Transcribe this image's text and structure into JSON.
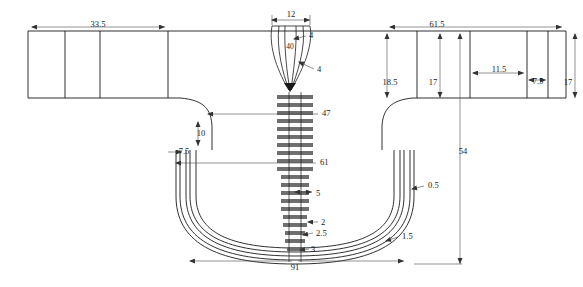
{
  "drawing": {
    "title": "Technical cross-section drawing with dimensions",
    "line_color": "#1a1a1a",
    "dim_line_color": "#666666",
    "dimensions": [
      {
        "id": "d_33_5",
        "label": "33.5",
        "x": 98,
        "y": 27,
        "size": "normal"
      },
      {
        "id": "d_12",
        "label": "12",
        "x": 291,
        "y": 17,
        "size": "normal"
      },
      {
        "id": "d_61_5",
        "label": "61.5",
        "x": 437,
        "y": 27,
        "size": "normal"
      },
      {
        "id": "d_4_top",
        "label": "4",
        "x": 300,
        "y": 36,
        "size": "normal"
      },
      {
        "id": "d_40",
        "label": "40",
        "x": 290,
        "y": 47,
        "size": "small"
      },
      {
        "id": "d_4_low",
        "label": "4",
        "x": 318,
        "y": 70,
        "size": "normal"
      },
      {
        "id": "d_18_5",
        "label": "18.5",
        "x": 390,
        "y": 83,
        "size": "normal"
      },
      {
        "id": "d_17_a",
        "label": "17",
        "x": 432,
        "y": 83,
        "size": "normal"
      },
      {
        "id": "d_11_5",
        "label": "11.5",
        "x": 499,
        "y": 72,
        "size": "normal"
      },
      {
        "id": "d_7_5_r",
        "label": "7.5",
        "x": 538,
        "y": 82,
        "size": "normal"
      },
      {
        "id": "d_17_b",
        "label": "17",
        "x": 567,
        "y": 83,
        "size": "normal"
      },
      {
        "id": "d_47",
        "label": "47",
        "x": 322,
        "y": 113,
        "size": "normal"
      },
      {
        "id": "d_10",
        "label": "10",
        "x": 203,
        "y": 133,
        "size": "normal"
      },
      {
        "id": "d_7_5_l",
        "label": "7.5",
        "x": 186,
        "y": 153,
        "size": "normal"
      },
      {
        "id": "d_61",
        "label": "61",
        "x": 320,
        "y": 162,
        "size": "normal"
      },
      {
        "id": "d_54",
        "label": "54",
        "x": 462,
        "y": 152,
        "size": "normal"
      },
      {
        "id": "d_0_5",
        "label": "0.5",
        "x": 428,
        "y": 186,
        "size": "normal"
      },
      {
        "id": "d_5",
        "label": "5",
        "x": 316,
        "y": 194,
        "size": "normal"
      },
      {
        "id": "d_2",
        "label": "2",
        "x": 322,
        "y": 223,
        "size": "normal"
      },
      {
        "id": "d_1_5",
        "label": "1.5",
        "x": 402,
        "y": 237,
        "size": "normal"
      },
      {
        "id": "d_2_5",
        "label": "2.5",
        "x": 317,
        "y": 237,
        "size": "normal"
      },
      {
        "id": "d_3",
        "label": "3",
        "x": 312,
        "y": 251,
        "size": "normal"
      },
      {
        "id": "d_91",
        "label": "91",
        "x": 295,
        "y": 266,
        "size": "normal"
      }
    ]
  }
}
